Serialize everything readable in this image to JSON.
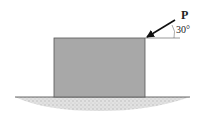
{
  "diagram": {
    "force_label": "P",
    "angle_label": "30°",
    "colors": {
      "block_fill": "#a8a8a8",
      "block_stroke": "#555555",
      "ground": "#cfcfcf",
      "arrow": "#111111"
    }
  }
}
